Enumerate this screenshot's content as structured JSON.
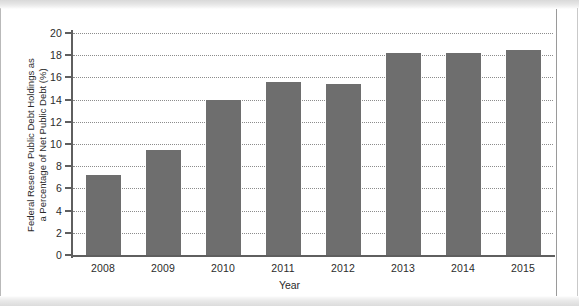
{
  "chart_data": {
    "type": "bar",
    "title": "",
    "xlabel": "Year",
    "ylabel": "Federal Reserve Public Debt Holdings as a Percentage of Net Public Debt (%)",
    "ylabel_line1": "Federal Reserve Public Debt Holdings as",
    "ylabel_line2": "a Percentage of Net Public Debt (%)",
    "categories": [
      "2008",
      "2009",
      "2010",
      "2011",
      "2012",
      "2013",
      "2014",
      "2015"
    ],
    "values": [
      7.2,
      9.5,
      14.0,
      15.6,
      15.4,
      18.2,
      18.2,
      18.5
    ],
    "ylim": [
      0,
      20
    ],
    "yticks": [
      "0",
      "2",
      "4",
      "6",
      "8",
      "10",
      "12",
      "14",
      "16",
      "18",
      "20"
    ],
    "ytick_values": [
      0,
      2,
      4,
      6,
      8,
      10,
      12,
      14,
      16,
      18,
      20
    ],
    "grid": true,
    "grid_style": "dotted-horizontal",
    "legend": "none",
    "bar_color": "#6e6e6e",
    "axis_color": "#5f5f5f",
    "background_color": "#ffffff"
  }
}
